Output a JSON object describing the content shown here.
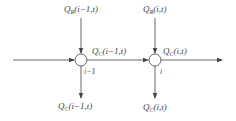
{
  "diagram": {
    "nodes": [
      {
        "id": "node-left",
        "index_label": "i−1",
        "cx": 81,
        "cy": 60
      },
      {
        "id": "node-right",
        "index_label": "i",
        "cx": 155,
        "cy": 60
      }
    ],
    "labels": {
      "qr_left": {
        "main": "Q",
        "sub": "R",
        "args": "(i−1,t)"
      },
      "qr_right": {
        "main": "Q",
        "sub": "R",
        "args": "(i,t)"
      },
      "qc_mid": {
        "main": "Q",
        "sub": "C",
        "args": "(i−1,t)"
      },
      "qc_right": {
        "main": "Q",
        "sub": "C",
        "args": "(i,t)"
      },
      "qc_bottom_left": {
        "main": "Q",
        "sub": "C",
        "args": "(i−1,t)"
      },
      "qc_bottom_right": {
        "main": "Q",
        "sub": "C",
        "args": "(i,t)"
      }
    },
    "colors": {
      "line": "#555555",
      "text": "#444444",
      "node_fill": "#ffffff"
    }
  }
}
